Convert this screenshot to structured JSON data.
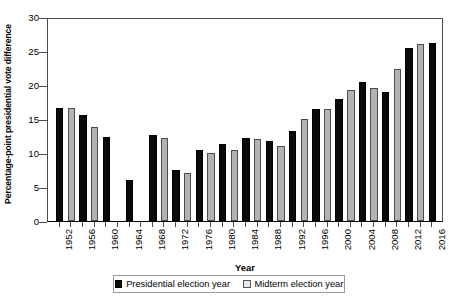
{
  "chart_data": {
    "type": "bar",
    "title": "",
    "xlabel": "Year",
    "ylabel": "Percentage-point presidential vote difference",
    "ylim": [
      0,
      30
    ],
    "yticks": [
      0,
      5,
      10,
      15,
      20,
      25,
      30
    ],
    "ytick_labels": [
      "0",
      "5",
      "10",
      "15",
      "20",
      "25",
      "30"
    ],
    "grid": false,
    "legend_position": "bottom",
    "categories": [
      "1952",
      "1954",
      "1956",
      "1958",
      "1960",
      "1962",
      "1964",
      "1966",
      "1968",
      "1970",
      "1972",
      "1974",
      "1976",
      "1978",
      "1980",
      "1982",
      "1984",
      "1986",
      "1988",
      "1990",
      "1992",
      "1994",
      "1996",
      "1998",
      "2000",
      "2002",
      "2004",
      "2006",
      "2008",
      "2010",
      "2012",
      "2014",
      "2016"
    ],
    "xtick_labels": [
      "1952",
      "1956",
      "1960",
      "1964",
      "1968",
      "1972",
      "1976",
      "1980",
      "1984",
      "1988",
      "1992",
      "1996",
      "2000",
      "2004",
      "2008",
      "2012",
      "2016"
    ],
    "series": [
      {
        "name": "Presidential election year",
        "color": "#0a0a0a",
        "points": [
          {
            "x": "1952",
            "y": 16.6
          },
          {
            "x": "1956",
            "y": 15.6
          },
          {
            "x": "1960",
            "y": 12.4
          },
          {
            "x": "1964",
            "y": 6.1
          },
          {
            "x": "1968",
            "y": 12.6
          },
          {
            "x": "1972",
            "y": 7.5
          },
          {
            "x": "1976",
            "y": 10.4
          },
          {
            "x": "1980",
            "y": 11.3
          },
          {
            "x": "1984",
            "y": 12.2
          },
          {
            "x": "1988",
            "y": 11.7
          },
          {
            "x": "1992",
            "y": 13.3
          },
          {
            "x": "1996",
            "y": 16.4
          },
          {
            "x": "2000",
            "y": 18.0
          },
          {
            "x": "2004",
            "y": 20.4
          },
          {
            "x": "2008",
            "y": 18.9
          },
          {
            "x": "2012",
            "y": 25.5
          },
          {
            "x": "2016",
            "y": 26.2
          }
        ]
      },
      {
        "name": "Midterm election year",
        "color": "#b3b3b3",
        "points": [
          {
            "x": "1954",
            "y": 16.6
          },
          {
            "x": "1958",
            "y": 13.8
          },
          {
            "x": "1962",
            "y": null
          },
          {
            "x": "1966",
            "y": null
          },
          {
            "x": "1970",
            "y": 12.2
          },
          {
            "x": "1974",
            "y": 7.1
          },
          {
            "x": "1978",
            "y": 10.0
          },
          {
            "x": "1982",
            "y": 10.4
          },
          {
            "x": "1986",
            "y": 12.0
          },
          {
            "x": "1990",
            "y": 11.0
          },
          {
            "x": "1994",
            "y": 15.0
          },
          {
            "x": "1998",
            "y": 16.4
          },
          {
            "x": "2002",
            "y": 19.2
          },
          {
            "x": "2006",
            "y": 19.5
          },
          {
            "x": "2010",
            "y": 22.4
          },
          {
            "x": "2014",
            "y": 26.0
          }
        ]
      }
    ]
  },
  "legend": {
    "items": [
      {
        "label": "Presidential election year",
        "kind": "pres"
      },
      {
        "label": "Midterm election year",
        "kind": "mid"
      }
    ]
  }
}
